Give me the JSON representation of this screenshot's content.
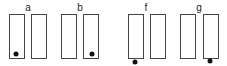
{
  "groups": [
    {
      "label": "a",
      "dot": "inside-left-bottom"
    },
    {
      "label": "b",
      "dot": "inside-right-bottom"
    },
    {
      "label": "f",
      "dot": "below-left"
    },
    {
      "label": "g",
      "dot": "below-right"
    }
  ]
}
